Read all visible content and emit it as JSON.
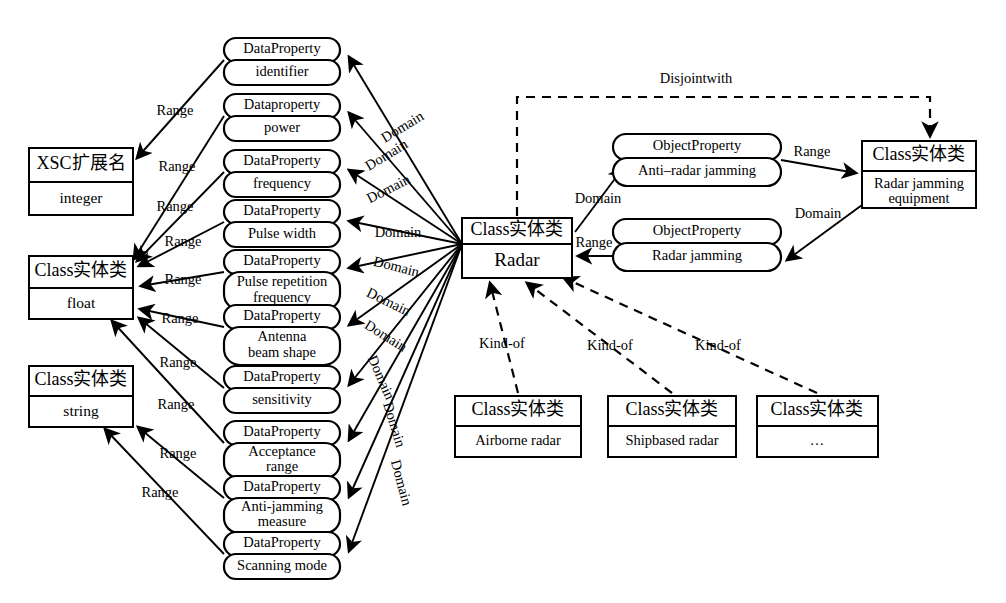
{
  "diagram": {
    "labels": {
      "range": "Range",
      "domain": "Domain",
      "kind_of": "Kind-of",
      "disjoint_with": "Disjointwith"
    },
    "data_properties": [
      {
        "header": "DataProperty",
        "name": "identifier"
      },
      {
        "header": "Dataproperty",
        "name": "power"
      },
      {
        "header": "DataProperty",
        "name": "frequency"
      },
      {
        "header": "DataProperty",
        "name": "Pulse width"
      },
      {
        "header": "DataProperty",
        "name": "Pulse repetition frequency"
      },
      {
        "header": "DataProperty",
        "name": "Antenna beam shape"
      },
      {
        "header": "DataProperty",
        "name": "sensitivity"
      },
      {
        "header": "DataProperty",
        "name": "Acceptance range"
      },
      {
        "header": "DataProperty",
        "name": "Anti-jamming measure"
      },
      {
        "header": "DataProperty",
        "name": "Scanning mode"
      }
    ],
    "datatype_nodes": [
      {
        "header": "XSC扩展名",
        "name": "integer"
      },
      {
        "header": "Class实体类",
        "name": "float"
      },
      {
        "header": "Class实体类",
        "name": "string"
      }
    ],
    "central_class": {
      "header": "Class实体类",
      "name": "Radar"
    },
    "object_properties": [
      {
        "header": "ObjectProperty",
        "name": "Anti–radar jamming"
      },
      {
        "header": "ObjectProperty",
        "name": "Radar jamming"
      }
    ],
    "jamming_equipment": {
      "header": "Class实体类",
      "name": "Radar jamming equipment"
    },
    "subclasses": [
      {
        "header": "Class实体类",
        "name": "Airborne radar"
      },
      {
        "header": "Class实体类",
        "name": "Shipbased radar"
      },
      {
        "header": "Class实体类",
        "name": "…"
      }
    ],
    "colors": {
      "stroke": "#000000",
      "fill": "#ffffff"
    }
  }
}
